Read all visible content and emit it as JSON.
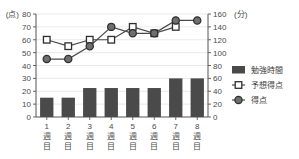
{
  "chart_data": {
    "type": "bar",
    "title": "",
    "categories": [
      "1週目",
      "2週目",
      "3週目",
      "4週目",
      "5週目",
      "6週目",
      "7週目",
      "8週目"
    ],
    "series": [
      {
        "name": "勉強時間",
        "type": "bar",
        "axis": "right",
        "unit": "分",
        "values": [
          30,
          30,
          45,
          45,
          45,
          45,
          60,
          60
        ]
      },
      {
        "name": "予想得点",
        "type": "line",
        "axis": "left",
        "unit": "点",
        "marker": "open-square",
        "values": [
          60,
          55,
          60,
          60,
          70,
          65,
          70,
          null
        ]
      },
      {
        "name": "得点",
        "type": "line",
        "axis": "left",
        "unit": "点",
        "marker": "filled-circle",
        "values": [
          45,
          45,
          55,
          70,
          65,
          65,
          75,
          75
        ]
      }
    ],
    "left_axis": {
      "unit_label": "(点)",
      "ticks": [
        0,
        10,
        20,
        30,
        40,
        50,
        60,
        70,
        80
      ],
      "min": 0,
      "max": 80
    },
    "right_axis": {
      "unit_label": "(分)",
      "ticks": [
        0,
        20,
        40,
        60,
        80,
        100,
        120,
        140,
        160
      ],
      "min": 0,
      "max": 160
    },
    "xlabel": "",
    "grid": true,
    "legend_position": "right"
  },
  "legend": {
    "items": [
      {
        "label": "勉強時間",
        "marker": "bar-swatch",
        "color": "#4a4a4a"
      },
      {
        "label": "予想得点",
        "marker": "open-square",
        "color": "#3a3a3a"
      },
      {
        "label": "得点",
        "marker": "filled-circle",
        "color": "#5a5a5a"
      }
    ]
  },
  "colors": {
    "bar_fill": "#4a4a4a",
    "line_stroke": "#4a4a4a",
    "marker_fill": "#6e6e6e",
    "marker_stroke": "#2f2f2f",
    "grid": "#e3e3e3",
    "axis": "#555555",
    "text": "#3a3a3a"
  }
}
